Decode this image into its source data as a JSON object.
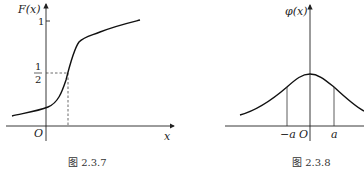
{
  "figures": [
    {
      "caption": "图 2.3.7",
      "y_label": "F(x)",
      "x_label": "x",
      "origin_label": "O",
      "tick_one": "1",
      "half_num": "1",
      "half_den": "2",
      "description": "S-shaped cumulative distribution function rising from near 0 to approaching 1, crossing 1/2 at a positive x"
    },
    {
      "caption": "图 2.3.8",
      "y_label": "φ(x)",
      "origin_label": "O",
      "neg_a_label": "−a",
      "pos_a_label": "a",
      "description": "Symmetric bell-shaped density curve centered at 0 with vertical lines at −a and a"
    }
  ]
}
